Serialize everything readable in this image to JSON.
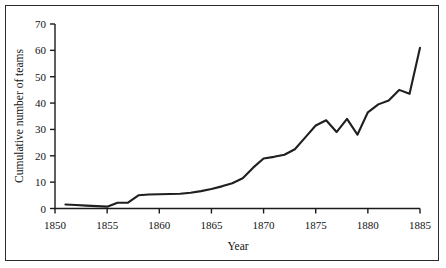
{
  "chart_data": {
    "type": "line",
    "title": "",
    "xlabel": "Year",
    "ylabel": "Cumulative number of teams",
    "xlim": [
      1850,
      1885
    ],
    "ylim": [
      0,
      70
    ],
    "xticks": [
      1850,
      1855,
      1860,
      1865,
      1870,
      1875,
      1880,
      1885
    ],
    "xtick_labels": [
      "1850",
      "1855",
      "1860",
      "1865",
      "1870",
      "1875",
      "1880",
      "1885"
    ],
    "yticks": [
      0,
      10,
      20,
      30,
      40,
      50,
      60,
      70
    ],
    "ytick_labels": [
      "0",
      "10",
      "20",
      "30",
      "40",
      "50",
      "60",
      "70"
    ],
    "grid": false,
    "legend": false,
    "line_color": "#1f1f1f",
    "series": [
      {
        "name": "Cumulative number of teams",
        "x": [
          1851,
          1852,
          1853,
          1854,
          1855,
          1856,
          1857,
          1858,
          1859,
          1860,
          1861,
          1862,
          1863,
          1864,
          1865,
          1866,
          1867,
          1868,
          1869,
          1870,
          1871,
          1872,
          1873,
          1874,
          1875,
          1876,
          1877,
          1878,
          1879,
          1880,
          1881,
          1882,
          1883,
          1884,
          1885
        ],
        "values": [
          1.5,
          1.3,
          1.1,
          0.9,
          0.7,
          2.2,
          2.2,
          5.0,
          5.3,
          5.4,
          5.5,
          5.6,
          6.0,
          6.6,
          7.4,
          8.4,
          9.6,
          11.5,
          15.5,
          19.0,
          19.6,
          20.4,
          22.5,
          27.0,
          31.5,
          33.5,
          29.0,
          34.0,
          28.0,
          36.5,
          39.5,
          41.0,
          45.0,
          43.5,
          61.0
        ]
      }
    ]
  }
}
